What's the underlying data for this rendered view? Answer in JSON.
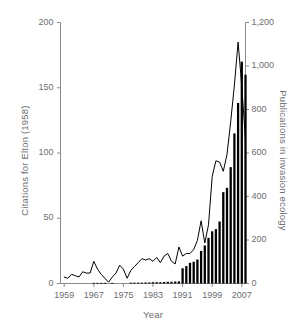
{
  "chart_data": {
    "type": "line",
    "title": "",
    "xlabel": "Year",
    "x": [
      1959,
      1960,
      1961,
      1962,
      1963,
      1964,
      1965,
      1966,
      1967,
      1968,
      1969,
      1970,
      1971,
      1972,
      1973,
      1974,
      1975,
      1976,
      1977,
      1978,
      1979,
      1980,
      1981,
      1982,
      1983,
      1984,
      1985,
      1986,
      1987,
      1988,
      1989,
      1990,
      1991,
      1992,
      1993,
      1994,
      1995,
      1996,
      1997,
      1998,
      1999,
      2000,
      2001,
      2002,
      2003,
      2004,
      2005,
      2006,
      2007,
      2008
    ],
    "xlim": [
      1958,
      2008
    ],
    "xticks": [
      1959,
      1967,
      1975,
      1983,
      1991,
      1999,
      2007
    ],
    "xticklabels": [
      "1959",
      "1967",
      "1975",
      "1983",
      "1991",
      "1999",
      "2007"
    ],
    "grid": false,
    "legend": null,
    "series": [
      {
        "name": "Citations for Elton (1958)",
        "type": "line",
        "axis": "left",
        "color": "#000000",
        "ylabel": "Citations for Elton (1958)",
        "ylim": [
          0,
          200
        ],
        "yticks": [
          0,
          50,
          100,
          150,
          200
        ],
        "yticklabels": [
          "0",
          "50",
          "100",
          "150",
          "200"
        ],
        "values": [
          5,
          4,
          7,
          6,
          5,
          9,
          8,
          8,
          17,
          11,
          7,
          4,
          1,
          5,
          8,
          14,
          11,
          4,
          10,
          13,
          16,
          19,
          18,
          19,
          17,
          20,
          16,
          21,
          23,
          17,
          15,
          28,
          21,
          23,
          23,
          26,
          33,
          48,
          31,
          45,
          82,
          94,
          93,
          86,
          99,
          124,
          152,
          185,
          151,
          110
        ]
      },
      {
        "name": "Publications in invasion ecology",
        "type": "bar",
        "axis": "right",
        "color": "#000000",
        "ylabel": "Publications in invasion ecology",
        "ylim": [
          0,
          1200
        ],
        "yticks": [
          0,
          200,
          400,
          600,
          800,
          1000,
          1200
        ],
        "yticklabels": [
          "0",
          "200",
          "400",
          "600",
          "800",
          "1,000",
          "1,200"
        ],
        "values": [
          0,
          0,
          0,
          0,
          0,
          0,
          0,
          0,
          3,
          3,
          3,
          3,
          0,
          3,
          0,
          0,
          0,
          0,
          4,
          4,
          4,
          4,
          5,
          5,
          6,
          6,
          6,
          7,
          8,
          8,
          9,
          10,
          70,
          80,
          95,
          100,
          110,
          150,
          175,
          210,
          240,
          250,
          285,
          420,
          440,
          535,
          690,
          830,
          1020,
          960
        ]
      }
    ]
  },
  "axes": {
    "left_title": "Citations for Elton (1958)",
    "right_title": "Publications in invasion ecology",
    "bottom_title": "Year"
  },
  "style": {
    "axis_color": "#8c8c8c",
    "text_color": "#6d6e71",
    "data_color": "#000000",
    "background": "#ffffff"
  }
}
